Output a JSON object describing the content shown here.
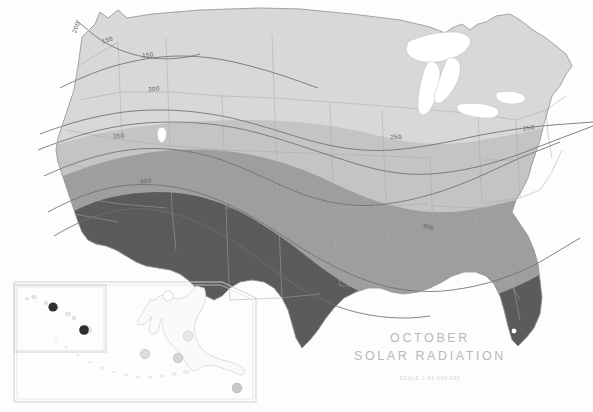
{
  "document": {
    "kind": "thematic-contour-map",
    "region": "United States",
    "background_color": "#ffffff"
  },
  "title": {
    "line1": "OCTOBER",
    "line2": "SOLAR  RADIATION",
    "scale": "SCALE  1:34,000,000",
    "color": "#b9b9b9"
  },
  "legend_zones": [
    {
      "name": "zone-lightest",
      "label": "under 200",
      "color": "#d7d8d8"
    },
    {
      "name": "zone-light",
      "label": "200 - 300",
      "color": "#c3c4c4"
    },
    {
      "name": "zone-medium",
      "label": "300 - 400",
      "color": "#9d9e9e"
    },
    {
      "name": "zone-dark",
      "label": "over 400",
      "color": "#5a5b5b"
    }
  ],
  "contours": [
    {
      "value": "150",
      "x": 107,
      "y": 40,
      "rotate": -16
    },
    {
      "value": "150",
      "x": 156,
      "y": 54,
      "rotate": -6
    },
    {
      "value": "200",
      "x": 78,
      "y": 26,
      "rotate": -72
    },
    {
      "value": "200",
      "x": 151,
      "y": 90,
      "rotate": -4
    },
    {
      "value": "250",
      "x": 395,
      "y": 138,
      "rotate": -3
    },
    {
      "value": "250",
      "x": 527,
      "y": 131,
      "rotate": -7
    },
    {
      "value": "300",
      "x": 152,
      "y": 91,
      "rotate": -5
    },
    {
      "value": "350",
      "x": 117,
      "y": 137,
      "rotate": -4
    },
    {
      "value": "400",
      "x": 144,
      "y": 182,
      "rotate": -8
    },
    {
      "value": "400",
      "x": 430,
      "y": 228,
      "rotate": 14
    }
  ],
  "insets": [
    {
      "name": "hawaii-inset",
      "label": "Hawaii",
      "marker_color": "#2f2f2f",
      "markers": 4
    },
    {
      "name": "alaska-inset",
      "label": "Alaska",
      "marker_color": "#cfcfcf",
      "markers": 6
    }
  ],
  "colors": {
    "outline": "#9a9a9a",
    "state_border": "#a9aaaa",
    "contour_line": "#6e6f6f",
    "inset_frame": "#cfcfcf",
    "water": "#ffffff"
  }
}
